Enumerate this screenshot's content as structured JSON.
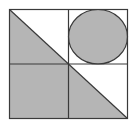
{
  "figure": {
    "colors": {
      "background": "#ffffff",
      "shade": "#b5b5b5",
      "stroke": "#3a3a3a"
    },
    "outer_square": {
      "x": 9.5,
      "y": 9.5,
      "width": 118,
      "height": 109
    },
    "dividers": {
      "vertical_x": 68.5,
      "horizontal_y": 64
    },
    "shapes": [
      {
        "name": "top-left-shaded-triangle",
        "points": "9.5,9.5 68.5,64 9.5,64"
      },
      {
        "name": "bottom-left-shaded-square",
        "x": 9.5,
        "y": 64,
        "width": 59,
        "height": 54.5
      },
      {
        "name": "bottom-right-shaded-triangle",
        "points": "68.5,64 127.5,118.5 68.5,118.5"
      },
      {
        "name": "top-right-inscribed-circle",
        "cx": 98,
        "cy": 36.75,
        "rx": 29.5,
        "ry": 27.25
      }
    ]
  }
}
